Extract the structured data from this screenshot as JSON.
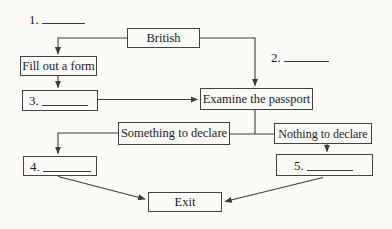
{
  "diagram_type": "flowchart",
  "colors": {
    "background": "#fbfaf6",
    "line": "#3c3c3c",
    "box_border": "#424242",
    "text": "#1b1b1b"
  },
  "nodes": {
    "blank1": {
      "number": "1."
    },
    "blank2": {
      "number": "2."
    },
    "british": {
      "label": "British"
    },
    "fill_form": {
      "label": "Fill out a form"
    },
    "blank3": {
      "number": "3."
    },
    "examine": {
      "label": "Examine the passport"
    },
    "something": {
      "label": "Something to declare"
    },
    "nothing": {
      "label": "Nothing to declare"
    },
    "blank4": {
      "number": "4."
    },
    "blank5": {
      "number": "5."
    },
    "exit": {
      "label": "Exit"
    }
  }
}
